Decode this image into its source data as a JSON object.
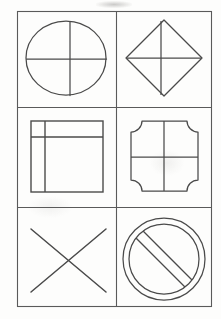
{
  "sheet": {
    "title": "Geometric Shapes Grid",
    "background_color": "#fdfdfc",
    "ink_color": "#4a4a4a",
    "description": "Hand-drawn style worksheet of six line-art geometric figures arranged in a 2-column by 3-row grid."
  },
  "grid": {
    "columns": 2,
    "rows": 3,
    "border_color": "#5a5a5a",
    "border_width": 1,
    "bounds": {
      "left": 17,
      "top": 11,
      "right": 211,
      "bottom": 306
    },
    "divider_x": 116,
    "divider_y_1": 107,
    "divider_y_2": 207
  },
  "cells": [
    {
      "position": "row1-col1",
      "figure_name": "circle-with-crosshair",
      "label": "Circle divided by vertical and horizontal diameters",
      "shape_type": "circle",
      "has_cross": true,
      "geometry": {
        "cx": 66,
        "cy": 58,
        "rx": 40,
        "ry": 37,
        "cross_vertical_x": 70,
        "cross_horizontal_y": 59
      }
    },
    {
      "position": "row1-col2",
      "figure_name": "diamond-with-diagonals",
      "label": "Diamond with both diagonals drawn",
      "shape_type": "diamond",
      "has_cross": true,
      "geometry": {
        "cx": 164,
        "cy": 58,
        "half_width": 38,
        "half_height": 38,
        "cross_vertical_x": 161,
        "cross_horizontal_y": 58
      }
    },
    {
      "position": "row2-col1",
      "figure_name": "square-with-corner-partition",
      "label": "Square with inner vertical line near left edge and horizontal line near top edge",
      "shape_type": "square",
      "has_cross": false,
      "geometry": {
        "x": 31,
        "y": 121,
        "width": 72,
        "height": 71,
        "inner_vertical_x": 45,
        "inner_horizontal_y": 137
      }
    },
    {
      "position": "row2-col2",
      "figure_name": "concave-corner-square-with-cross",
      "label": "Square with inward-curving concave corners divided into four quadrants",
      "shape_type": "concave-square",
      "has_cross": true,
      "geometry": {
        "x": 131,
        "y": 121,
        "width": 67,
        "height": 70,
        "corner_radius": 11,
        "cross_vertical_x": 164,
        "cross_horizontal_y": 157
      }
    },
    {
      "position": "row3-col1",
      "figure_name": "x-cross",
      "label": "Large X formed by two crossing diagonal lines",
      "shape_type": "x-mark",
      "has_cross": true,
      "geometry": {
        "x1": 31,
        "y1": 229,
        "x2": 106,
        "y2": 292,
        "x3": 106,
        "y3": 229,
        "x4": 31,
        "y4": 292
      }
    },
    {
      "position": "row3-col2",
      "figure_name": "prohibition-sign",
      "label": "No-entry sign: concentric ring circles with a diagonal bar",
      "shape_type": "prohibition",
      "has_cross": false,
      "geometry": {
        "cx": 164,
        "cy": 259,
        "outer_r": 41,
        "inner_r": 35,
        "bar_angle_deg": 45,
        "bar_half_width": 5
      }
    }
  ]
}
